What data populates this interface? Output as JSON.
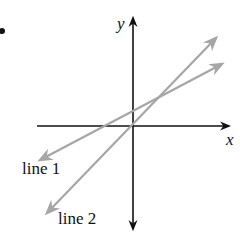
{
  "diagram": {
    "type": "coordinate-plane-two-lines",
    "bullet_marker": "•",
    "axes": {
      "x_label": "x",
      "y_label": "y",
      "color": "#111111"
    },
    "lines": [
      {
        "label": "line 1",
        "color": "#a6a6a6",
        "description": "shallower positive slope, positive y-intercept",
        "start": [
          40,
          160
        ],
        "end": [
          222,
          64
        ]
      },
      {
        "label": "line 2",
        "color": "#a6a6a6",
        "description": "steeper positive slope, passes through origin",
        "start": [
          47,
          213
        ],
        "end": [
          216,
          38
        ]
      }
    ]
  }
}
